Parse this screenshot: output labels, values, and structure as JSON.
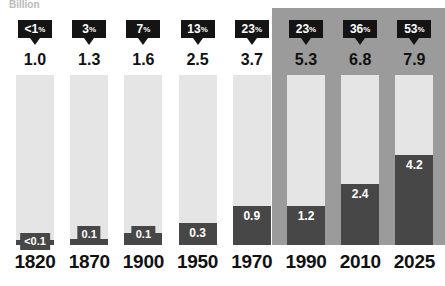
{
  "chart_data": {
    "type": "bar",
    "subtype": "stacked-bar",
    "title": "",
    "subtitle": "",
    "unit_label": "Billion",
    "xlabel": "",
    "ylabel": "Billion",
    "grid": false,
    "legend_position": "none",
    "categories": [
      "1820",
      "1870",
      "1900",
      "1950",
      "1970",
      "1990",
      "2010",
      "2025"
    ],
    "totals": [
      "1.0",
      "1.3",
      "1.6",
      "2.5",
      "3.7",
      "5.3",
      "6.8",
      "7.9"
    ],
    "totals_numeric": [
      1.0,
      1.3,
      1.6,
      2.5,
      3.7,
      5.3,
      6.8,
      7.9
    ],
    "urban_labels": [
      "<0.1",
      "0.1",
      "0.1",
      "0.3",
      "0.9",
      "1.2",
      "2.4",
      "4.2"
    ],
    "urban_numeric": [
      0.05,
      0.1,
      0.1,
      0.3,
      0.9,
      1.2,
      2.4,
      4.2
    ],
    "percent_labels": [
      "<1%",
      "3%",
      "7%",
      "13%",
      "23%",
      "23%",
      "36%",
      "53%"
    ],
    "percent_numeric": [
      0.5,
      3,
      7,
      13,
      23,
      23,
      36,
      53
    ],
    "series": [
      {
        "name": "Urban",
        "values": [
          0.05,
          0.1,
          0.1,
          0.3,
          0.9,
          1.2,
          2.4,
          4.2
        ],
        "color": "#474747"
      },
      {
        "name": "Rest",
        "values": [
          0.95,
          1.2,
          1.5,
          2.2,
          2.8,
          4.1,
          4.4,
          3.7
        ],
        "color": "#e5e5e5"
      }
    ],
    "bars_normalized": true,
    "highlighted_categories": [
      "1990",
      "2010",
      "2025"
    ],
    "colors": {
      "urban": "#474747",
      "rest": "#e5e5e5",
      "badge": "#141414",
      "badge_text": "#ffffff",
      "highlight_panel": "#9b9b9b",
      "total_text": "#111111",
      "year_text": "#111111",
      "unit_text": "#b9b9b9",
      "background": "#ffffff"
    }
  },
  "columns": [
    {
      "year": "1820",
      "total": "1.0",
      "percent_number": "<1",
      "percent_sign": "%",
      "urban_label": "<0.1",
      "urban_fraction": 0.028,
      "highlighted": false,
      "label_style": "chip-baseline"
    },
    {
      "year": "1870",
      "total": "1.3",
      "percent_number": "3",
      "percent_sign": "%",
      "urban_label": "0.1",
      "urban_fraction": 0.035,
      "highlighted": false,
      "label_style": "chip-raised"
    },
    {
      "year": "1900",
      "total": "1.6",
      "percent_number": "7",
      "percent_sign": "%",
      "urban_label": "0.1",
      "urban_fraction": 0.07,
      "highlighted": false,
      "label_style": "chip-raised"
    },
    {
      "year": "1950",
      "total": "2.5",
      "percent_number": "13",
      "percent_sign": "%",
      "urban_label": "0.3",
      "urban_fraction": 0.13,
      "highlighted": false,
      "label_style": "inside"
    },
    {
      "year": "1970",
      "total": "3.7",
      "percent_number": "23",
      "percent_sign": "%",
      "urban_label": "0.9",
      "urban_fraction": 0.23,
      "highlighted": false,
      "label_style": "inside"
    },
    {
      "year": "1990",
      "total": "5.3",
      "percent_number": "23",
      "percent_sign": "%",
      "urban_label": "1.2",
      "urban_fraction": 0.23,
      "highlighted": true,
      "label_style": "inside"
    },
    {
      "year": "2010",
      "total": "6.8",
      "percent_number": "36",
      "percent_sign": "%",
      "urban_label": "2.4",
      "urban_fraction": 0.36,
      "highlighted": true,
      "label_style": "inside"
    },
    {
      "year": "2025",
      "total": "7.9",
      "percent_number": "53",
      "percent_sign": "%",
      "urban_label": "4.2",
      "urban_fraction": 0.53,
      "highlighted": true,
      "label_style": "inside"
    }
  ],
  "layout": {
    "bar_left_first": 16,
    "bar_width": 38,
    "bar_pitch": 54.2,
    "bar_top": 75,
    "bar_height": 170,
    "panel_left": 272,
    "panel_top": 8,
    "panel_width": 173,
    "panel_height": 237
  }
}
